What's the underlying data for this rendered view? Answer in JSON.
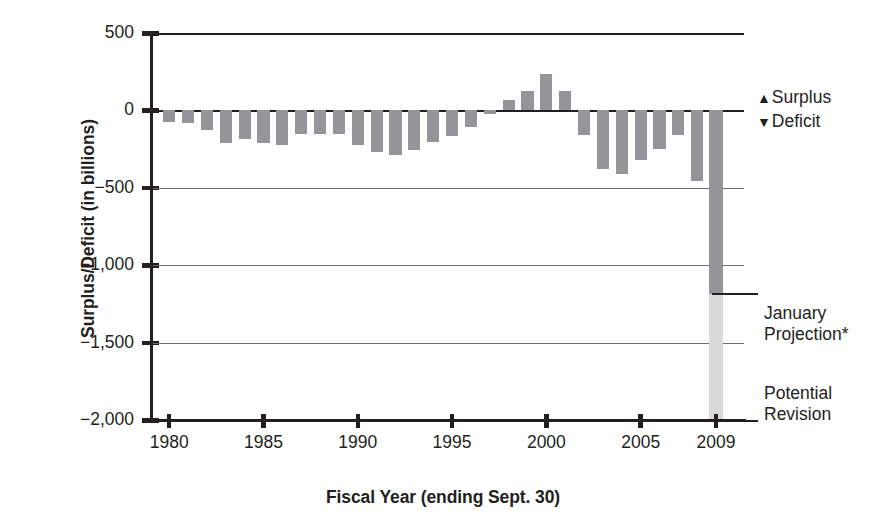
{
  "chart_data": {
    "type": "bar",
    "title": "",
    "xlabel": "Fiscal Year (ending Sept. 30)",
    "ylabel": "Surplus/Deficit (in billions)",
    "ylim": [
      -2000,
      500
    ],
    "yticks": [
      500,
      0,
      -500,
      -1000,
      -1500,
      -2000
    ],
    "ytick_labels": [
      "500",
      "0",
      "−500",
      "−1,000",
      "−1,500",
      "−2,000"
    ],
    "xticks": [
      1980,
      1985,
      1990,
      1995,
      2000,
      2005,
      2009
    ],
    "xtick_labels": [
      "1980",
      "1985",
      "1990",
      "1995",
      "2000",
      "2005",
      "2009"
    ],
    "grid": "horizontal",
    "legend_position": "right-top",
    "bar_color": "#939598",
    "projection_color": "#939598",
    "revision_color": "#d9dadb",
    "axis_color": "#231f20",
    "gridline_color": "#6d6e71",
    "categories": [
      1980,
      1981,
      1982,
      1983,
      1984,
      1985,
      1986,
      1987,
      1988,
      1989,
      1990,
      1991,
      1992,
      1993,
      1994,
      1995,
      1996,
      1997,
      1998,
      1999,
      2000,
      2001,
      2002,
      2003,
      2004,
      2005,
      2006,
      2007,
      2008,
      2009
    ],
    "values": [
      -74,
      -79,
      -128,
      -208,
      -185,
      -212,
      -221,
      -150,
      -155,
      -153,
      -221,
      -269,
      -290,
      -255,
      -203,
      -164,
      -107,
      -22,
      69,
      126,
      236,
      128,
      -158,
      -378,
      -413,
      -318,
      -248,
      -161,
      -459,
      -1186
    ],
    "series": [
      {
        "name": "Surplus/Deficit",
        "values": [
          -74,
          -79,
          -128,
          -208,
          -185,
          -212,
          -221,
          -150,
          -155,
          -153,
          -221,
          -269,
          -290,
          -255,
          -203,
          -164,
          -107,
          -22,
          69,
          126,
          236,
          128,
          -158,
          -378,
          -413,
          -318,
          -248,
          -161,
          -459,
          -1186
        ]
      }
    ],
    "annotations": [
      {
        "label": "January Projection*",
        "year": 2009,
        "value": -1186
      },
      {
        "label": "Potential Revision",
        "year": 2009,
        "value": -2000
      }
    ],
    "legend": [
      {
        "marker": "▲",
        "label": "Surplus"
      },
      {
        "marker": "▼",
        "label": "Deficit"
      }
    ]
  },
  "legend": {
    "surplus_marker": "▲",
    "surplus_label": "Surplus",
    "deficit_marker": "▼",
    "deficit_label": "Deficit"
  },
  "callouts": {
    "january_projection_line1": "January",
    "january_projection_line2": "Projection*",
    "potential_revision_line1": "Potential",
    "potential_revision_line2": "Revision"
  },
  "axes": {
    "y_title": "Surplus/Deficit (in billions)",
    "x_title": "Fiscal Year (ending Sept. 30)"
  }
}
